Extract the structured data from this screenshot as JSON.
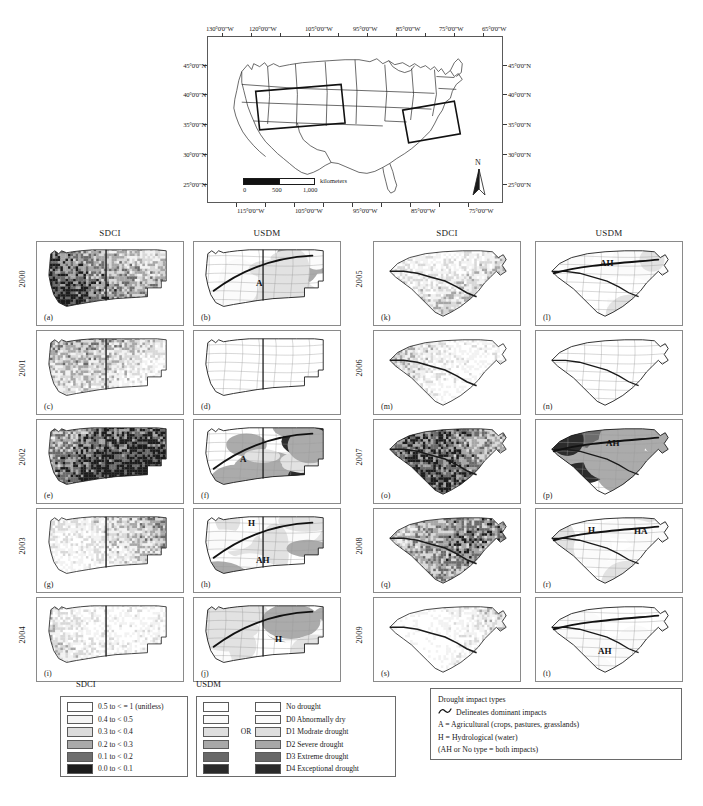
{
  "overview_map": {
    "name": "United States overview map with study area outlines",
    "lon_top_labels": [
      "130°0'0\"W",
      "120°0'0\"W",
      "105°0'0\"W",
      "95°0'0\"W",
      "85°0'0\"W",
      "75°0'0\"W",
      "65°0'0\"W"
    ],
    "lon_bottom_labels": [
      "115°0'0\"W",
      "105°0'0\"W",
      "95°0'0\"W",
      "85°0'0\"W",
      "75°0'0\"W"
    ],
    "lat_labels": [
      "45°0'0\"N",
      "40°0'0\"N",
      "35°0'0\"N",
      "30°0'0\"N",
      "25°0'0\"N"
    ],
    "scalebar": {
      "unit_label": "kilometers",
      "ticks": [
        "0",
        "500",
        "1,000"
      ]
    },
    "north_arrow_label": "N"
  },
  "grids": {
    "left": {
      "columns": [
        "SDCI",
        "USDM"
      ],
      "rows": [
        {
          "year": "2000",
          "sdci_tag": "(a)",
          "usdm_tag": "(b)",
          "impacts": [
            {
              "label": "A",
              "x": 62,
              "y": 36
            }
          ]
        },
        {
          "year": "2001",
          "sdci_tag": "(c)",
          "usdm_tag": "(d)",
          "impacts": []
        },
        {
          "year": "2002",
          "sdci_tag": "(e)",
          "usdm_tag": "(f)",
          "impacts": [
            {
              "label": "A",
              "x": 46,
              "y": 34
            }
          ]
        },
        {
          "year": "2003",
          "sdci_tag": "(g)",
          "usdm_tag": "(h)",
          "impacts": [
            {
              "label": "H",
              "x": 54,
              "y": 9
            },
            {
              "label": "AH",
              "x": 62,
              "y": 46
            }
          ]
        },
        {
          "year": "2004",
          "sdci_tag": "(i)",
          "usdm_tag": "(j)",
          "impacts": [
            {
              "label": "H",
              "x": 81,
              "y": 36
            }
          ]
        }
      ]
    },
    "right": {
      "columns": [
        "SDCI",
        "USDM"
      ],
      "rows": [
        {
          "year": "2005",
          "sdci_tag": "(k)",
          "usdm_tag": "(l)",
          "impacts": [
            {
              "label": "AH",
              "x": 64,
              "y": 16
            }
          ]
        },
        {
          "year": "2006",
          "sdci_tag": "(m)",
          "usdm_tag": "(n)",
          "impacts": []
        },
        {
          "year": "2007",
          "sdci_tag": "(o)",
          "usdm_tag": "(p)",
          "impacts": [
            {
              "label": "AH",
              "x": 70,
              "y": 18
            }
          ]
        },
        {
          "year": "2008",
          "sdci_tag": "(q)",
          "usdm_tag": "(r)",
          "impacts": [
            {
              "label": "H",
              "x": 52,
              "y": 16
            },
            {
              "label": "HA",
              "x": 98,
              "y": 17
            }
          ]
        },
        {
          "year": "2009",
          "sdci_tag": "(s)",
          "usdm_tag": "(t)",
          "impacts": [
            {
              "label": "AH",
              "x": 62,
              "y": 48
            }
          ]
        }
      ]
    }
  },
  "legends": {
    "sdci": {
      "title": "SDCI",
      "entries": [
        {
          "label": "0.5 to < = 1  (unitless)",
          "color": "#ffffff"
        },
        {
          "label": "0.4 to < 0.5",
          "color": "#f4f4f4"
        },
        {
          "label": "0.3 to < 0.4",
          "color": "#dcdcdc"
        },
        {
          "label": "0.2 to < 0.3",
          "color": "#aaaaaa"
        },
        {
          "label": "0.1 to < 0.2",
          "color": "#6e6e6e"
        },
        {
          "label": "0.0 to < 0.1",
          "color": "#1c1c1c"
        }
      ]
    },
    "usdm": {
      "title": "USDM",
      "or_label": "OR",
      "entries": [
        {
          "label": "No drought",
          "color": "#ffffff"
        },
        {
          "label": "D0 Abnormally dry",
          "color": "#fafafa"
        },
        {
          "label": "D1 Modrate drought",
          "color": "#dedede"
        },
        {
          "label": "D2 Severe drought",
          "color": "#a8a8a8"
        },
        {
          "label": "D3 Extreme drought",
          "color": "#686868"
        },
        {
          "label": "D4 Exceptional drought",
          "color": "#2a2a2a"
        }
      ]
    },
    "impacts": {
      "title": "Drought impact types",
      "delineate_label": "Delineates dominant impacts",
      "lines": [
        "A = Agricultural (crops, pastures, grasslands)",
        "H = Hydrological (water)",
        "(AH or No type = both impacts)"
      ]
    }
  }
}
